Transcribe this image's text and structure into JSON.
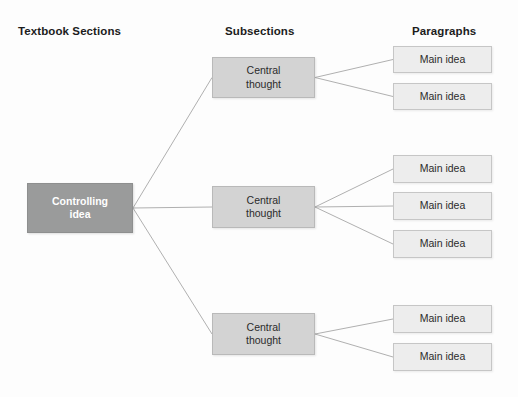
{
  "page": {
    "background_color": "#fdfdfd",
    "width": 518,
    "height": 397
  },
  "headers": {
    "left": "Textbook Sections",
    "middle": "Subsections",
    "right": "Paragraphs"
  },
  "colors": {
    "root_fill": "#9a9b9b",
    "root_text": "#ffffff",
    "mid_fill": "#d3d3d3",
    "mid_text": "#2b2b2b",
    "leaf_fill": "#ededed",
    "leaf_text": "#2b2b2b",
    "connector": "#b0b0b0"
  },
  "root": {
    "label": "Controlling\nidea",
    "x": 27,
    "y": 183,
    "w": 106,
    "h": 50
  },
  "branches": [
    {
      "central": {
        "label": "Central\nthought",
        "x": 212,
        "y": 57,
        "w": 103,
        "h": 41
      },
      "leaves": [
        {
          "label": "Main idea",
          "x": 393,
          "y": 46,
          "w": 99,
          "h": 27
        },
        {
          "label": "Main idea",
          "x": 393,
          "y": 83,
          "w": 99,
          "h": 27
        }
      ]
    },
    {
      "central": {
        "label": "Central\nthought",
        "x": 212,
        "y": 186,
        "w": 103,
        "h": 42
      },
      "leaves": [
        {
          "label": "Main idea",
          "x": 393,
          "y": 155,
          "w": 99,
          "h": 28
        },
        {
          "label": "Main idea",
          "x": 393,
          "y": 192,
          "w": 99,
          "h": 28
        },
        {
          "label": "Main idea",
          "x": 393,
          "y": 230,
          "w": 99,
          "h": 28
        }
      ]
    },
    {
      "central": {
        "label": "Central\nthought",
        "x": 212,
        "y": 313,
        "w": 103,
        "h": 42
      },
      "leaves": [
        {
          "label": "Main idea",
          "x": 393,
          "y": 305,
          "w": 99,
          "h": 28
        },
        {
          "label": "Main idea",
          "x": 393,
          "y": 343,
          "w": 99,
          "h": 28
        }
      ]
    }
  ]
}
